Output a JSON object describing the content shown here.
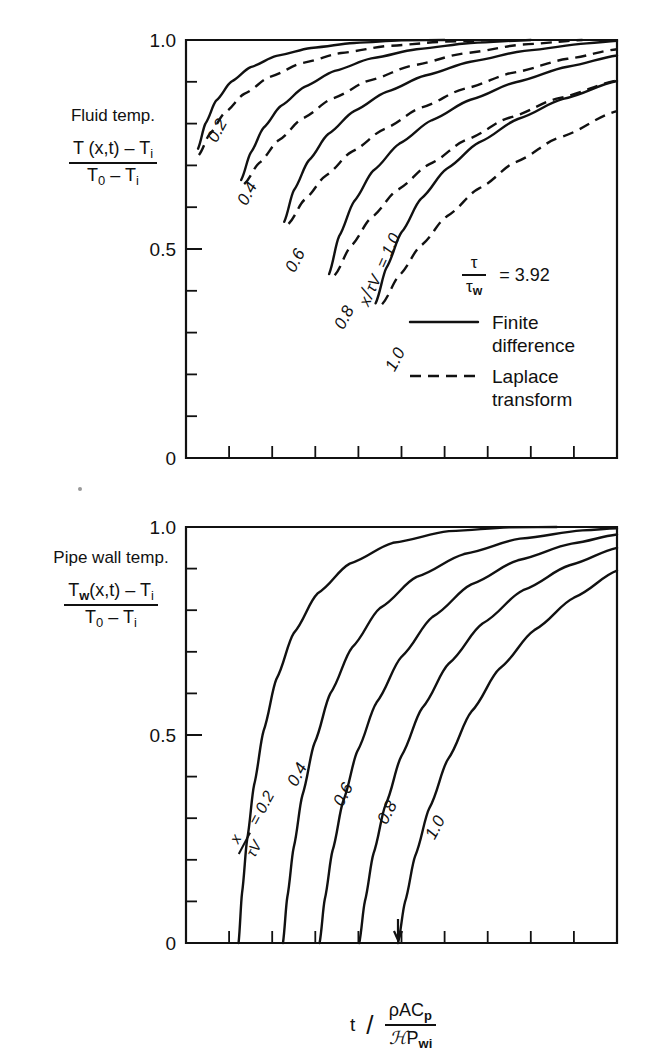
{
  "figure": {
    "background": "#ffffff",
    "ink_color": "#111111"
  },
  "panels": [
    {
      "id": "fluid-temp-panel",
      "name": "Fluid temperature panel",
      "axis_title_line1": "Fluid temp.",
      "axis_title_num": "T (x,t) – T",
      "axis_title_num_sub": "i",
      "axis_title_den_a": "T",
      "axis_title_den_a_sub": "0",
      "axis_title_den_b": " – T",
      "axis_title_den_b_sub": "i",
      "ytick_labels": [
        "1.0",
        "0.5",
        "0"
      ],
      "ytick_values": [
        1.0,
        0.5,
        0.0
      ],
      "y_minor_divisions": 10,
      "x_minor_divisions": 10,
      "legend": {
        "ratio_num": "τ",
        "ratio_den": "τ",
        "ratio_den_sub": "w",
        "ratio_equals": "= 3.92",
        "entries": [
          {
            "style": "solid",
            "label_line1": "Finite",
            "label_line2": "difference"
          },
          {
            "style": "dashed",
            "label_line1": "Laplace",
            "label_line2": "transform"
          }
        ]
      },
      "curve_group_label": {
        "num": "x",
        "den_tau": "τ",
        "den_v": "V",
        "equals": "= 1.0"
      },
      "curve_labels": [
        "0.2",
        "0.4",
        "0.6",
        "0.8",
        "1.0"
      ]
    },
    {
      "id": "pipe-wall-temp-panel",
      "name": "Pipe wall temperature panel",
      "axis_title_line1": "Pipe wall temp.",
      "axis_title_num": "T",
      "axis_title_num_sub": "w",
      "axis_title_num_rest": "(x,t) – T",
      "axis_title_num_rest_sub": "i",
      "axis_title_den_a": "T",
      "axis_title_den_a_sub": "0",
      "axis_title_den_b": " – T",
      "axis_title_den_b_sub": "i",
      "ytick_labels": [
        "1.0",
        "0.5",
        "0"
      ],
      "ytick_values": [
        1.0,
        0.5,
        0.0
      ],
      "y_minor_divisions": 10,
      "x_minor_divisions": 10,
      "curve_group_label": {
        "num": "x",
        "den_tau": "τ",
        "den_v": "V",
        "equals": "= 0.2"
      },
      "curve_labels": [
        "0.4",
        "0.6",
        "0.8",
        "1.0"
      ]
    }
  ],
  "xaxis_title": {
    "variable": "t",
    "slash": "/",
    "numerator": "ρAC",
    "numerator_sub": "p",
    "denominator_script": "ℋ",
    "denominator_rest": "P",
    "denominator_rest_sub": "wi"
  },
  "chart_data": {
    "type": "line",
    "title": "",
    "xlabel": "t / (ρAC_p / ℋP_wi)",
    "panels": [
      {
        "name": "Fluid temperature",
        "ylabel": "(T(x,t) - T_i) / (T_0 - T_i)",
        "ylim": [
          0,
          1.0
        ],
        "xlim": [
          0,
          10
        ],
        "yticks": [
          0,
          0.5,
          1.0
        ],
        "grid": false,
        "annotation": "τ/τ_w = 3.92",
        "legend": [
          "Finite difference",
          "Laplace transform"
        ],
        "legend_position": "lower-right",
        "series": [
          {
            "name": "x/τV = 0.2",
            "style": "solid",
            "points": [
              [
                0.28,
                0.74
              ],
              [
                0.45,
                0.8
              ],
              [
                0.7,
                0.855
              ],
              [
                1.05,
                0.9
              ],
              [
                1.5,
                0.935
              ],
              [
                2.1,
                0.962
              ],
              [
                2.9,
                0.981
              ],
              [
                3.9,
                0.993
              ],
              [
                5.0,
                0.999
              ],
              [
                6.0,
                1.0
              ]
            ]
          },
          {
            "name": "x/τV = 0.2 (Laplace)",
            "style": "dashed",
            "points": [
              [
                0.3,
                0.725
              ],
              [
                0.55,
                0.775
              ],
              [
                0.9,
                0.826
              ],
              [
                1.35,
                0.871
              ],
              [
                1.95,
                0.912
              ],
              [
                2.7,
                0.945
              ],
              [
                3.6,
                0.969
              ],
              [
                4.7,
                0.986
              ],
              [
                6.0,
                0.996
              ],
              [
                7.2,
                1.0
              ]
            ]
          },
          {
            "name": "x/τV = 0.4",
            "style": "solid",
            "points": [
              [
                1.28,
                0.665
              ],
              [
                1.5,
                0.73
              ],
              [
                1.8,
                0.79
              ],
              [
                2.2,
                0.842
              ],
              [
                2.75,
                0.888
              ],
              [
                3.45,
                0.926
              ],
              [
                4.3,
                0.956
              ],
              [
                5.35,
                0.978
              ],
              [
                6.6,
                0.993
              ],
              [
                8.0,
                1.0
              ]
            ]
          },
          {
            "name": "x/τV = 0.4 (Laplace)",
            "style": "dashed",
            "points": [
              [
                1.35,
                0.655
              ],
              [
                1.7,
                0.706
              ],
              [
                2.15,
                0.76
              ],
              [
                2.7,
                0.812
              ],
              [
                3.4,
                0.86
              ],
              [
                4.25,
                0.903
              ],
              [
                5.25,
                0.939
              ],
              [
                6.45,
                0.968
              ],
              [
                7.8,
                0.989
              ],
              [
                9.2,
                1.0
              ]
            ]
          },
          {
            "name": "x/τV = 0.6",
            "style": "solid",
            "points": [
              [
                2.28,
                0.565
              ],
              [
                2.5,
                0.64
              ],
              [
                2.85,
                0.712
              ],
              [
                3.3,
                0.775
              ],
              [
                3.9,
                0.83
              ],
              [
                4.65,
                0.876
              ],
              [
                5.55,
                0.915
              ],
              [
                6.6,
                0.948
              ],
              [
                7.85,
                0.974
              ],
              [
                9.3,
                0.992
              ],
              [
                10,
                0.998
              ]
            ]
          },
          {
            "name": "x/τV = 0.6 (Laplace)",
            "style": "dashed",
            "points": [
              [
                2.38,
                0.56
              ],
              [
                2.75,
                0.618
              ],
              [
                3.25,
                0.676
              ],
              [
                3.85,
                0.733
              ],
              [
                4.6,
                0.787
              ],
              [
                5.45,
                0.838
              ],
              [
                6.45,
                0.883
              ],
              [
                7.6,
                0.922
              ],
              [
                8.85,
                0.955
              ],
              [
                10,
                0.978
              ]
            ]
          },
          {
            "name": "x/τV = 0.8",
            "style": "solid",
            "points": [
              [
                3.32,
                0.44
              ],
              [
                3.55,
                0.53
              ],
              [
                3.9,
                0.614
              ],
              [
                4.35,
                0.688
              ],
              [
                4.95,
                0.752
              ],
              [
                5.7,
                0.808
              ],
              [
                6.6,
                0.857
              ],
              [
                7.65,
                0.899
              ],
              [
                8.85,
                0.936
              ],
              [
                10,
                0.963
              ]
            ]
          },
          {
            "name": "x/τV = 0.8 (Laplace)",
            "style": "dashed",
            "points": [
              [
                3.45,
                0.437
              ],
              [
                3.82,
                0.506
              ],
              [
                4.3,
                0.575
              ],
              [
                4.9,
                0.641
              ],
              [
                5.65,
                0.703
              ],
              [
                6.5,
                0.761
              ],
              [
                7.5,
                0.814
              ],
              [
                8.65,
                0.861
              ],
              [
                10,
                0.903
              ]
            ]
          },
          {
            "name": "x/τV = 1.0",
            "style": "solid",
            "points": [
              [
                4.4,
                0.37
              ],
              [
                4.65,
                0.455
              ],
              [
                5.0,
                0.54
              ],
              [
                5.45,
                0.62
              ],
              [
                6.05,
                0.692
              ],
              [
                6.8,
                0.755
              ],
              [
                7.7,
                0.811
              ],
              [
                8.75,
                0.859
              ],
              [
                10,
                0.902
              ]
            ]
          },
          {
            "name": "x/τV = 1.0 (Laplace)",
            "style": "dashed",
            "points": [
              [
                4.55,
                0.368
              ],
              [
                4.95,
                0.437
              ],
              [
                5.45,
                0.508
              ],
              [
                6.05,
                0.578
              ],
              [
                6.8,
                0.645
              ],
              [
                7.65,
                0.708
              ],
              [
                8.65,
                0.766
              ],
              [
                10,
                0.83
              ]
            ]
          }
        ]
      },
      {
        "name": "Pipe wall temperature",
        "ylabel": "(T_w(x,t) - T_i) / (T_0 - T_i)",
        "ylim": [
          0,
          1.0
        ],
        "xlim": [
          0,
          10
        ],
        "yticks": [
          0,
          0.5,
          1.0
        ],
        "grid": false,
        "series": [
          {
            "name": "x/τV = 0.2",
            "style": "solid",
            "points": [
              [
                1.22,
                0.0
              ],
              [
                1.3,
                0.12
              ],
              [
                1.42,
                0.25
              ],
              [
                1.58,
                0.38
              ],
              [
                1.8,
                0.51
              ],
              [
                2.1,
                0.635
              ],
              [
                2.5,
                0.745
              ],
              [
                3.05,
                0.84
              ],
              [
                3.8,
                0.912
              ],
              [
                4.8,
                0.962
              ],
              [
                6.1,
                0.99
              ],
              [
                7.5,
                0.999
              ],
              [
                8.6,
                1.0
              ]
            ]
          },
          {
            "name": "x/τV = 0.4",
            "style": "solid",
            "points": [
              [
                2.25,
                0.0
              ],
              [
                2.35,
                0.11
              ],
              [
                2.5,
                0.23
              ],
              [
                2.7,
                0.355
              ],
              [
                2.98,
                0.48
              ],
              [
                3.35,
                0.6
              ],
              [
                3.85,
                0.71
              ],
              [
                4.5,
                0.805
              ],
              [
                5.35,
                0.88
              ],
              [
                6.45,
                0.935
              ],
              [
                7.75,
                0.972
              ],
              [
                9.2,
                0.992
              ],
              [
                10,
                0.997
              ]
            ]
          },
          {
            "name": "x/τV = 0.6",
            "style": "solid",
            "points": [
              [
                3.1,
                0.0
              ],
              [
                3.22,
                0.105
              ],
              [
                3.4,
                0.222
              ],
              [
                3.65,
                0.342
              ],
              [
                3.98,
                0.462
              ],
              [
                4.42,
                0.578
              ],
              [
                5.0,
                0.688
              ],
              [
                5.72,
                0.784
              ],
              [
                6.62,
                0.862
              ],
              [
                7.7,
                0.92
              ],
              [
                8.95,
                0.96
              ],
              [
                10,
                0.982
              ]
            ]
          },
          {
            "name": "x/τV = 0.8",
            "style": "solid",
            "points": [
              [
                4.02,
                0.0
              ],
              [
                4.15,
                0.1
              ],
              [
                4.35,
                0.215
              ],
              [
                4.63,
                0.332
              ],
              [
                5.0,
                0.45
              ],
              [
                5.48,
                0.565
              ],
              [
                6.1,
                0.672
              ],
              [
                6.88,
                0.768
              ],
              [
                7.82,
                0.848
              ],
              [
                8.9,
                0.908
              ],
              [
                10,
                0.95
              ]
            ]
          },
          {
            "name": "x/τV = 1.0",
            "style": "solid",
            "points": [
              [
                4.92,
                0.0
              ],
              [
                5.08,
                0.098
              ],
              [
                5.32,
                0.21
              ],
              [
                5.65,
                0.325
              ],
              [
                6.08,
                0.442
              ],
              [
                6.62,
                0.556
              ],
              [
                7.28,
                0.66
              ],
              [
                8.08,
                0.752
              ],
              [
                9.0,
                0.83
              ],
              [
                10,
                0.895
              ]
            ]
          }
        ]
      }
    ]
  }
}
